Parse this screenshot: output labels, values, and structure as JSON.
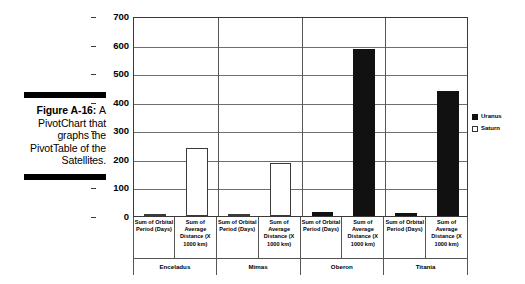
{
  "caption": {
    "figure_number": "Figure A-16:",
    "text": "A PivotChart that graphs the PivotTable of the Satellites."
  },
  "legend": {
    "position": "right",
    "items": [
      {
        "label": "Uranus",
        "color": "#111111",
        "style": "filled"
      },
      {
        "label": "Saturn",
        "color": "#ffffff",
        "style": "outlined"
      }
    ]
  },
  "axis": {
    "y_ticks": [
      "700",
      "600",
      "500",
      "400",
      "300",
      "200",
      "100",
      "0"
    ]
  },
  "chart_data": {
    "type": "bar",
    "title": "",
    "xlabel": "",
    "ylabel": "",
    "ylim": [
      0,
      700
    ],
    "yticks": [
      0,
      100,
      200,
      300,
      400,
      500,
      600,
      700
    ],
    "grid": true,
    "legend_position": "right",
    "groups": [
      "Enceladus",
      "Mimas",
      "Oberon",
      "Titania"
    ],
    "categories": [
      "Sum of Orbital Period (Days)",
      "Sum of Average Distance (X 1000 km)",
      "Sum of Orbital Period (Days)",
      "Sum of Average Distance (X 1000 km)",
      "Sum of Orbital Period (Days)",
      "Sum of Average Distance (X 1000 km)",
      "Sum of Orbital Period (Days)",
      "Sum of Average Distance (X 1000 km)"
    ],
    "series": [
      {
        "name": "Uranus",
        "color": "#111111",
        "values": [
          null,
          null,
          null,
          null,
          13,
          583,
          9,
          436
        ]
      },
      {
        "name": "Saturn",
        "color": "#ffffff",
        "values": [
          1,
          238,
          1,
          186,
          null,
          null,
          null,
          null
        ]
      }
    ],
    "points": [
      {
        "group": "Enceladus",
        "category": "Sum of Orbital Period (Days)",
        "series": "Saturn",
        "value": 1
      },
      {
        "group": "Enceladus",
        "category": "Sum of Average Distance (X 1000 km)",
        "series": "Saturn",
        "value": 238
      },
      {
        "group": "Mimas",
        "category": "Sum of Orbital Period (Days)",
        "series": "Saturn",
        "value": 1
      },
      {
        "group": "Mimas",
        "category": "Sum of Average Distance (X 1000 km)",
        "series": "Saturn",
        "value": 186
      },
      {
        "group": "Oberon",
        "category": "Sum of Orbital Period (Days)",
        "series": "Uranus",
        "value": 13
      },
      {
        "group": "Oberon",
        "category": "Sum of Average Distance (X 1000 km)",
        "series": "Uranus",
        "value": 583
      },
      {
        "group": "Titania",
        "category": "Sum of Orbital Period (Days)",
        "series": "Uranus",
        "value": 9
      },
      {
        "group": "Titania",
        "category": "Sum of Average Distance (X 1000 km)",
        "series": "Uranus",
        "value": 436
      }
    ]
  }
}
